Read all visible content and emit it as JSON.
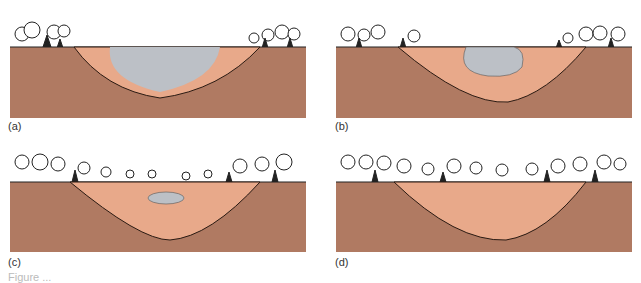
{
  "figure": {
    "panels": [
      {
        "id": "a",
        "label": "(a)",
        "stage": "open lake, thin sediment lining"
      },
      {
        "id": "b",
        "label": "(b)",
        "stage": "sediment infilling, lake shrinking"
      },
      {
        "id": "c",
        "label": "(c)",
        "stage": "small pond remains in sediment"
      },
      {
        "id": "d",
        "label": "(d)",
        "stage": "basin fully filled, forested surface"
      }
    ],
    "caption_partial": "Figure ..."
  },
  "colors": {
    "bedrock": "#b07a62",
    "sediment": "#e8a98a",
    "water": "#bcc0c6",
    "outline": "#2a1a12",
    "tree": "#222222"
  }
}
